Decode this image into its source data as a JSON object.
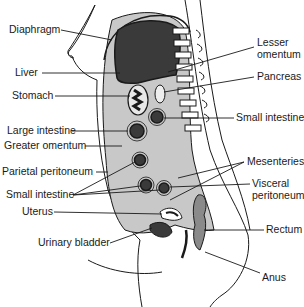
{
  "diagram": {
    "colors": {
      "outline": "#1a1a1a",
      "peritoneal_fill": "#c8c8c8",
      "organ_dark": "#3a3a3a",
      "rectum_fill": "#8a8a8a",
      "background": "#ffffff"
    },
    "labels_left": [
      {
        "id": "diaphragm",
        "text": "Diaphragm"
      },
      {
        "id": "liver",
        "text": "Liver"
      },
      {
        "id": "stomach",
        "text": "Stomach"
      },
      {
        "id": "large_intestine",
        "text": "Large intestine"
      },
      {
        "id": "greater_omentum",
        "text": "Greater omentum"
      },
      {
        "id": "parietal_peritoneum",
        "text": "Parietal peritoneum"
      },
      {
        "id": "small_intestine_left",
        "text": "Small intestine"
      },
      {
        "id": "uterus",
        "text": "Uterus"
      },
      {
        "id": "urinary_bladder",
        "text": "Urinary bladder"
      }
    ],
    "labels_right": [
      {
        "id": "lesser_omentum",
        "text": "Lesser\nomentum",
        "line1": "Lesser",
        "line2": "omentum"
      },
      {
        "id": "pancreas",
        "text": "Pancreas"
      },
      {
        "id": "small_intestine_right",
        "text": "Small intestine"
      },
      {
        "id": "mesenteries",
        "text": "Mesenteries"
      },
      {
        "id": "visceral_peritoneum",
        "text": "Visceral\nperitoneum",
        "line1": "Visceral",
        "line2": "peritoneum"
      },
      {
        "id": "rectum",
        "text": "Rectum"
      },
      {
        "id": "anus",
        "text": "Anus"
      }
    ]
  }
}
